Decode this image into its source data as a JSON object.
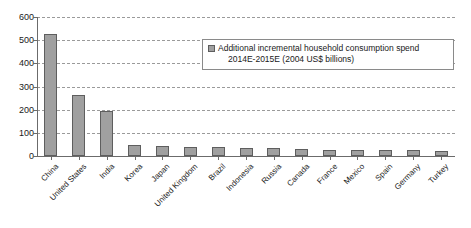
{
  "chart_data": {
    "type": "bar",
    "title": "",
    "xlabel": "",
    "ylabel": "",
    "ylim": [
      0,
      600
    ],
    "y_ticks": [
      0,
      100,
      200,
      300,
      400,
      500,
      600
    ],
    "grid": true,
    "legend_position": "top-right-inside",
    "legend": [
      {
        "name": "Additional incremental household consumption spend 2014E-2015E (2004 US$ billions)",
        "line1": "Additional incremental household consumption spend",
        "line2": "2014E-2015E (2004 US$ billions)",
        "color": "#a0a0a0"
      }
    ],
    "categories": [
      "China",
      "United States",
      "India",
      "Korea",
      "Japan",
      "United Kingdom",
      "Brazil",
      "Indonesia",
      "Russia",
      "Canada",
      "France",
      "Mexico",
      "Spain",
      "Germany",
      "Turkey"
    ],
    "values": [
      525,
      265,
      196,
      46,
      43,
      40,
      41,
      35,
      33,
      29,
      28,
      25,
      25,
      25,
      23
    ],
    "series": [
      {
        "name": "Additional incremental household consumption spend 2014E-2015E (2004 US$ billions)",
        "values": [
          525,
          265,
          196,
          46,
          43,
          40,
          41,
          35,
          33,
          29,
          28,
          25,
          25,
          25,
          23
        ]
      }
    ]
  },
  "colors": {
    "bar_fill": "#a0a0a0",
    "bar_stroke": "#5e5e5e",
    "gridline": "#9a9a9a",
    "axis": "#6b6b6b",
    "text": "#1a1a1a",
    "background": "#ffffff"
  }
}
